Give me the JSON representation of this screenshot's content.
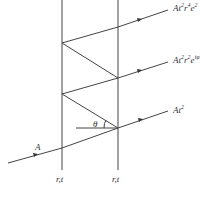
{
  "diagram": {
    "incident_label": "A",
    "angle_label": "θ",
    "surface_labels": [
      "r,t",
      "r,t"
    ],
    "outputs": [
      {
        "base": "At",
        "t_exp": "2",
        "r": "r",
        "r_exp": "4",
        "e": "e",
        "e_exp": "2"
      },
      {
        "base": "At",
        "t_exp": "2",
        "r": "r",
        "r_exp": "2",
        "e": "e",
        "e_exp": "iφ"
      },
      {
        "base": "At",
        "t_exp": "2"
      }
    ]
  }
}
